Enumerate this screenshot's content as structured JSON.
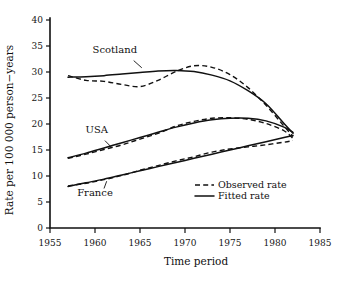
{
  "chart_data": {
    "type": "line",
    "title": "",
    "xlabel": "Time period",
    "ylabel": "Rate per 100 000 person−years",
    "xlim": [
      1955,
      1985
    ],
    "ylim": [
      0,
      40
    ],
    "xticks": [
      1955,
      1960,
      1965,
      1970,
      1975,
      1980,
      1985
    ],
    "yticks": [
      0,
      5,
      10,
      15,
      20,
      25,
      30,
      35,
      40
    ],
    "grid": false,
    "legend_position": "inside-lower-right",
    "legend": [
      {
        "label": "Observed rate",
        "style": "dashed"
      },
      {
        "label": "Fitted rate",
        "style": "solid"
      }
    ],
    "annotations": [
      {
        "text": "Scotland",
        "x": 1962.2,
        "y": 33.6
      },
      {
        "text": "USA",
        "x": 1960.2,
        "y": 18.2
      },
      {
        "text": "France",
        "x": 1960.0,
        "y": 6.1
      }
    ],
    "series": [
      {
        "name": "Scotland",
        "style": "fitted",
        "x": [
          1957,
          1959,
          1961,
          1963,
          1965,
          1967,
          1969,
          1971,
          1973,
          1975,
          1977,
          1979,
          1981,
          1982
        ],
        "values": [
          29.0,
          29.1,
          29.3,
          29.6,
          29.9,
          30.2,
          30.3,
          30.1,
          29.4,
          28.3,
          26.4,
          23.9,
          20.1,
          18.2
        ]
      },
      {
        "name": "Scotland",
        "style": "observed",
        "x": [
          1957,
          1959,
          1961,
          1963,
          1965,
          1967,
          1969,
          1971,
          1973,
          1975,
          1977,
          1979,
          1981,
          1982
        ],
        "values": [
          29.3,
          28.4,
          28.2,
          27.6,
          27.2,
          28.4,
          30.1,
          31.2,
          30.9,
          29.5,
          27.0,
          23.6,
          19.6,
          17.6
        ]
      },
      {
        "name": "USA",
        "style": "fitted",
        "x": [
          1957,
          1959,
          1961,
          1963,
          1965,
          1967,
          1969,
          1971,
          1973,
          1975,
          1977,
          1979,
          1981,
          1982
        ],
        "values": [
          13.5,
          14.4,
          15.4,
          16.4,
          17.4,
          18.4,
          19.4,
          20.2,
          20.8,
          21.1,
          21.1,
          20.6,
          19.4,
          18.4
        ]
      },
      {
        "name": "USA",
        "style": "observed",
        "x": [
          1957,
          1959,
          1961,
          1963,
          1965,
          1967,
          1969,
          1971,
          1973,
          1975,
          1977,
          1979,
          1981,
          1982
        ],
        "values": [
          13.4,
          14.2,
          15.1,
          16.0,
          17.1,
          18.2,
          19.6,
          20.5,
          21.1,
          21.2,
          20.9,
          20.1,
          18.7,
          17.2
        ]
      },
      {
        "name": "France",
        "style": "fitted",
        "x": [
          1957,
          1959,
          1961,
          1963,
          1965,
          1967,
          1969,
          1971,
          1973,
          1975,
          1977,
          1979,
          1981,
          1982
        ],
        "values": [
          8.0,
          8.7,
          9.4,
          10.2,
          11.0,
          11.8,
          12.6,
          13.4,
          14.2,
          15.0,
          15.8,
          16.6,
          17.4,
          17.8
        ]
      },
      {
        "name": "France",
        "style": "observed",
        "x": [
          1957,
          1959,
          1961,
          1963,
          1965,
          1967,
          1969,
          1971,
          1973,
          1975,
          1977,
          1979,
          1981,
          1982
        ],
        "values": [
          8.1,
          8.6,
          9.3,
          10.1,
          11.1,
          12.0,
          12.9,
          13.7,
          14.6,
          15.2,
          15.6,
          16.0,
          16.5,
          16.8
        ]
      }
    ]
  }
}
